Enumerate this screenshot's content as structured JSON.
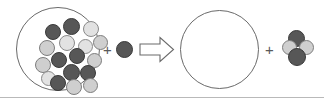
{
  "diagram": {
    "type": "particulate-reaction-schematic",
    "title": "",
    "background_color": "#ffffff",
    "border_color": "#b9b9b9",
    "operators": [
      {
        "name": "plus-sign-reactants",
        "symbol": "+",
        "x": 103,
        "y": 42
      },
      {
        "name": "plus-sign-products",
        "symbol": "+",
        "x": 265,
        "y": 42
      }
    ],
    "arrow": {
      "name": "reaction-arrow",
      "direction": "right",
      "style": "hollow-block",
      "stroke_color": "#6a6a6a",
      "fill_color": "#ffffff",
      "x": 139,
      "y": 36,
      "width": 36,
      "height": 27
    },
    "reactant_vessel": {
      "label": "",
      "shape": "circle",
      "x": 16,
      "y": 7,
      "width": 84,
      "height": 84,
      "stroke_color": "#6a6a6a",
      "fill_color": "transparent",
      "particle_count": 17,
      "particles": [
        {
          "x": 28,
          "y": 16,
          "d": 16,
          "shade": "dark"
        },
        {
          "x": 46,
          "y": 10,
          "d": 17,
          "shade": "dark"
        },
        {
          "x": 66,
          "y": 13,
          "d": 16,
          "shade": "pale"
        },
        {
          "x": 22,
          "y": 32,
          "d": 16,
          "shade": "light"
        },
        {
          "x": 42,
          "y": 27,
          "d": 16,
          "shade": "pale"
        },
        {
          "x": 61,
          "y": 31,
          "d": 15,
          "shade": "pale"
        },
        {
          "x": 76,
          "y": 27,
          "d": 15,
          "shade": "light"
        },
        {
          "x": 34,
          "y": 44,
          "d": 16,
          "shade": "dark"
        },
        {
          "x": 52,
          "y": 40,
          "d": 16,
          "shade": "dark"
        },
        {
          "x": 70,
          "y": 45,
          "d": 15,
          "shade": "light"
        },
        {
          "x": 18,
          "y": 49,
          "d": 16,
          "shade": "light"
        },
        {
          "x": 46,
          "y": 56,
          "d": 17,
          "shade": "dark"
        },
        {
          "x": 63,
          "y": 57,
          "d": 16,
          "shade": "dark"
        },
        {
          "x": 24,
          "y": 63,
          "d": 15,
          "shade": "pale"
        },
        {
          "x": 33,
          "y": 67,
          "d": 16,
          "shade": "dark"
        },
        {
          "x": 49,
          "y": 71,
          "d": 16,
          "shade": "light"
        },
        {
          "x": 66,
          "y": 70,
          "d": 15,
          "shade": "light"
        }
      ]
    },
    "free_reactant": {
      "name": "free-reactant-particle",
      "shade": "dark",
      "x": 116,
      "y": 41,
      "d": 17
    },
    "product_vessel": {
      "label": "",
      "shape": "circle",
      "x": 180,
      "y": 10,
      "width": 79,
      "height": 79,
      "stroke_color": "#6a6a6a",
      "fill_color": "transparent",
      "particle_count": 0,
      "particles": []
    },
    "product_cluster": {
      "name": "product-cluster",
      "particle_count": 4,
      "particles": [
        {
          "x": 6,
          "y": 0,
          "d": 17,
          "shade": "dark"
        },
        {
          "x": 0,
          "y": 10,
          "d": 15,
          "shade": "light"
        },
        {
          "x": 17,
          "y": 10,
          "d": 15,
          "shade": "light"
        },
        {
          "x": 6,
          "y": 18,
          "d": 18,
          "shade": "dark"
        }
      ]
    },
    "shades": {
      "dark": "#575757",
      "mid": "#8d8d8d",
      "light": "#cfcfcf",
      "pale": "#e2e2e2"
    }
  }
}
